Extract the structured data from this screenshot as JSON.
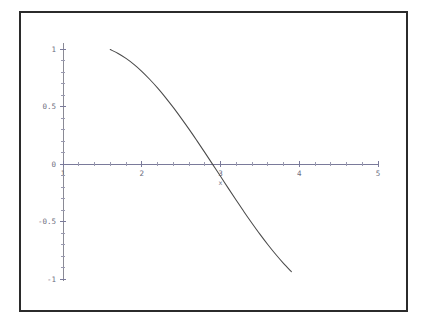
{
  "figure": {
    "background_color": "#ffffff",
    "frame_color": "#2b2b2b",
    "axis_color": "#7a7a9a",
    "curve_color": "#4a4a4a",
    "label_color": "#6d6d80"
  },
  "chart_data": {
    "type": "line",
    "title": "",
    "subtitle": "",
    "xlabel": "x",
    "ylabel": "",
    "xlim": [
      1,
      5
    ],
    "ylim": [
      -1,
      1
    ],
    "grid": false,
    "legend": false,
    "legend_position": "none",
    "x_ticks": [
      1,
      2,
      3,
      4,
      5
    ],
    "x_tick_labels": [
      "1",
      "2",
      "3",
      "4",
      "5"
    ],
    "y_ticks": [
      -1,
      -0.5,
      0,
      0.5,
      1
    ],
    "y_tick_labels": [
      "-1",
      "-0.5",
      "0",
      "0.5",
      "1"
    ],
    "x_minor_tick_count": 5,
    "y_minor_tick_count": 5,
    "zero_crossing_x": 3.92,
    "peak": {
      "x": 1.4,
      "y": 1.04
    },
    "series": [
      {
        "name": "curve",
        "color": "#4a4a4a",
        "x": [
          1.0,
          1.1,
          1.2,
          1.3,
          1.4,
          1.5,
          1.6,
          1.7,
          1.8,
          1.9,
          2.0,
          2.1,
          2.2,
          2.3,
          2.4,
          2.5,
          2.6,
          2.7,
          2.8,
          2.9,
          3.0,
          3.1,
          3.2,
          3.3,
          3.4,
          3.5,
          3.6,
          3.7,
          3.8,
          3.9,
          4.0,
          4.1,
          4.2,
          4.3,
          4.4,
          4.5,
          4.6,
          4.7,
          4.8,
          4.9,
          5.0
        ],
        "y": [
          1.0,
          1.024,
          1.037,
          1.041,
          1.035,
          1.02,
          0.995,
          0.961,
          0.918,
          0.866,
          0.806,
          0.737,
          0.662,
          0.58,
          0.492,
          0.399,
          0.303,
          0.203,
          0.101,
          -0.003,
          -0.107,
          -0.212,
          -0.315,
          -0.417,
          -0.515,
          -0.61,
          -0.7,
          -0.785,
          -0.864,
          -0.936,
          -1.001,
          -1.058,
          -1.106,
          -1.146,
          -1.176,
          -1.197,
          -1.209,
          -1.211,
          -1.204,
          -1.188,
          -1.162
        ],
        "clipped_to_ylim": true
      }
    ],
    "labels_visible": {
      "x_axis_name": "x"
    }
  }
}
